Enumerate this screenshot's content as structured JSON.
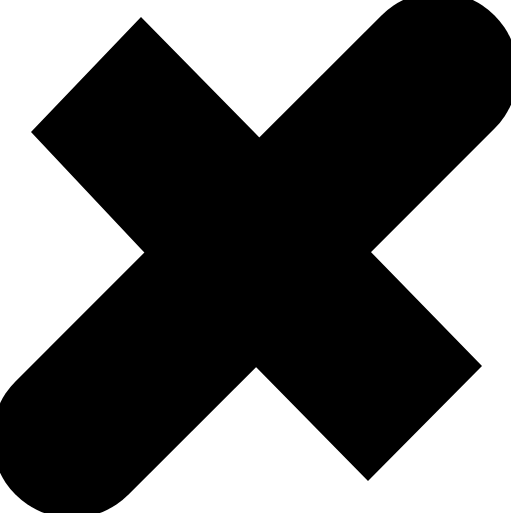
{
  "icon": {
    "name": "close-icon",
    "glyph": "✕",
    "fill_color": "#000000",
    "background_color": "#ffffff"
  }
}
